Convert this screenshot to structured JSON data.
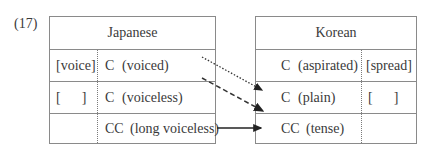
{
  "example_number": "(17)",
  "japanese": {
    "title": "Japanese",
    "rows": [
      {
        "feature": "[voice]",
        "segment": "C",
        "gloss": "(voiced)"
      },
      {
        "feature": "[      ]",
        "segment": "C",
        "gloss": "(voiceless)"
      },
      {
        "feature": "",
        "segment": "CC",
        "gloss": "(long voiceless)"
      }
    ]
  },
  "korean": {
    "title": "Korean",
    "rows": [
      {
        "segment": "C",
        "gloss": "(aspirated)",
        "feature": "[spread]"
      },
      {
        "segment": "C",
        "gloss": "(plain)",
        "feature": "[      ]"
      },
      {
        "segment": "CC",
        "gloss": "(tense)",
        "feature": ""
      }
    ]
  },
  "mappings": [
    {
      "from": "C (voiced)",
      "to": "C (plain)",
      "style": "dotted"
    },
    {
      "from": "C (voiceless)",
      "to": "CC (tense)",
      "style": "dashed"
    },
    {
      "from": "CC (long voiceless)",
      "to": "CC (tense)",
      "style": "solid"
    }
  ]
}
